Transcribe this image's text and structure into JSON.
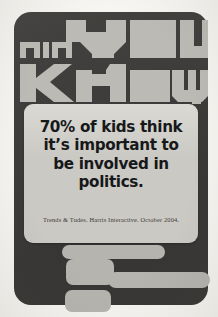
{
  "poster": {
    "headline": {
      "line1_small": "DID",
      "line1_large": "YOU",
      "line2": "KNOW?",
      "full_text": "DID YOU KNOW?",
      "style": "blocky-stencil"
    },
    "statement": {
      "lines": [
        "70% of kids think",
        "it’s important to",
        "be involved in",
        "politics."
      ],
      "full_text": "70% of kids think it’s important to be involved in politics.",
      "stat_value": "70%"
    },
    "citation": "Trends & Tudes. Harris Interactive. October 2004."
  },
  "colors": {
    "page_background": "#f6f5f1",
    "panel_dark": "#3b3a38",
    "headline_light": "#bcbab4",
    "card_background": "#cbc9c3",
    "statement_text": "#17181a",
    "citation_text": "#3c3b39",
    "mark_light": "#b6b4ae"
  }
}
